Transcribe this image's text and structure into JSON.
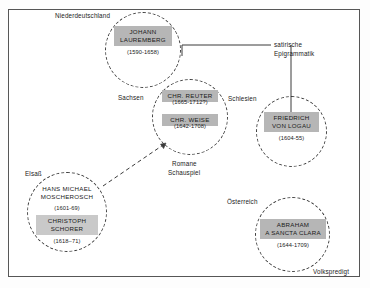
{
  "diagram": {
    "nodes": [
      {
        "id": "niederdeutschland",
        "region_label": "Niederdeutschland",
        "persons": [
          {
            "name_line1": "JOHANN",
            "name_line2": "LAUREMBERG",
            "dates": "(1590-1658)"
          }
        ]
      },
      {
        "id": "sachsen",
        "region_label": "Sachsen",
        "persons": [
          {
            "name_line1": "CHR. REUTER",
            "name_line2": "",
            "dates": "(1665-1712?)"
          },
          {
            "name_line1": "CHR. WEISE",
            "name_line2": "",
            "dates": "(1642-1708)"
          }
        ],
        "genre_line1": "Romane",
        "genre_line2": "Schauspiel"
      },
      {
        "id": "schlesien",
        "region_label": "Schlesien",
        "persons": [
          {
            "name_line1": "FRIEDRICH",
            "name_line2": "VON LOGAU",
            "dates": "(1604-55)"
          }
        ]
      },
      {
        "id": "elsass",
        "region_label": "Elsaß",
        "persons": [
          {
            "name_line1": "HANS MICHAEL",
            "name_line2": "MOSCHEROSCH",
            "dates": "(1601-69)"
          },
          {
            "name_line1": "CHRISTOPH",
            "name_line2": "SCHORER",
            "dates": "(1618–71)"
          }
        ]
      },
      {
        "id": "oesterreich",
        "region_label": "Österreich",
        "persons": [
          {
            "name_line1": "ABRAHAM",
            "name_line2": "A SANCTA CLARA",
            "dates": "(1644-1709)"
          }
        ],
        "genre_line1": "Volkspredigt"
      }
    ],
    "annotations": {
      "satire_line1": "satirische",
      "satire_line2": "Epigrammatik"
    },
    "colors": {
      "namebox_fill": "#b6b6b6",
      "namebox_fill_light": "#c9c9c9",
      "stroke": "#3a3a3a",
      "frame": "#565656",
      "text": "#1a1a1a",
      "background": "#ffffff"
    }
  }
}
